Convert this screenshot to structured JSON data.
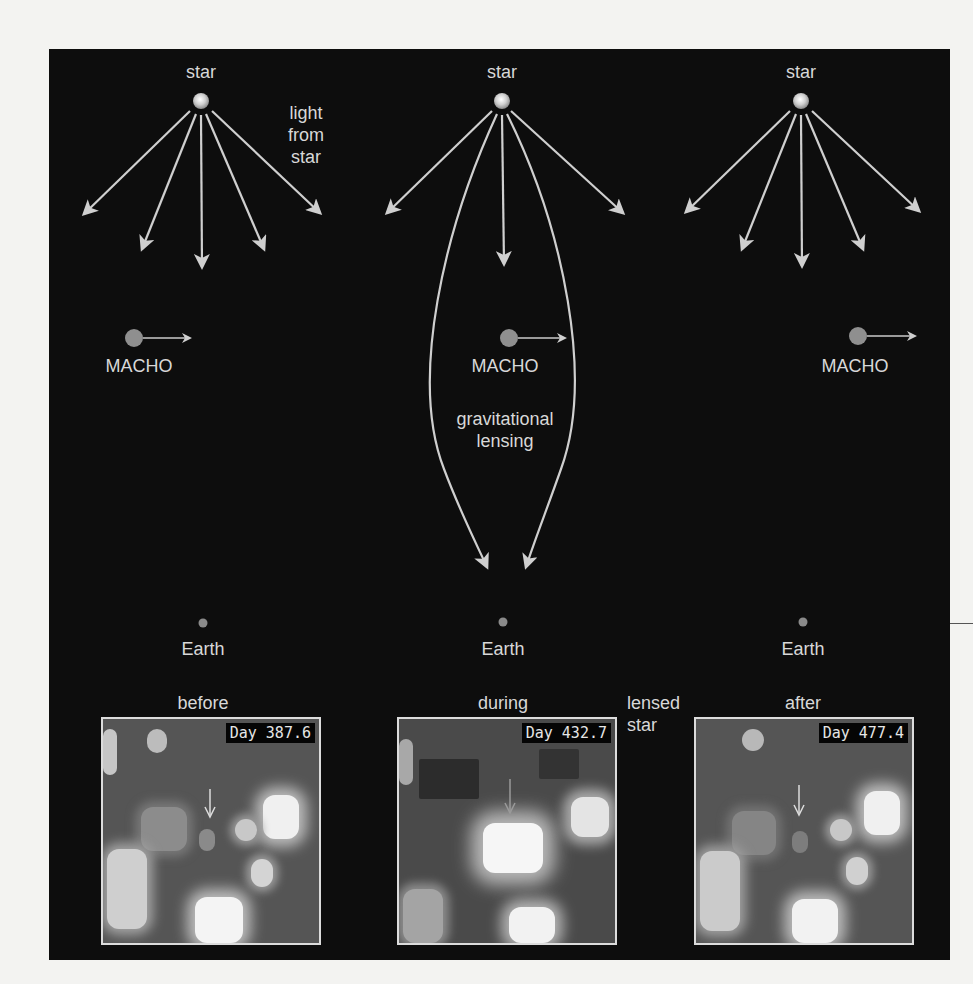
{
  "figure": {
    "background_color": "#0d0d0d",
    "line_color": "#d0d0d0",
    "panels": [
      {
        "id": "before",
        "star_label": "star",
        "macho_label": "MACHO",
        "earth_label": "Earth",
        "phase_label": "before",
        "annotation": "light\nfrom\nstar",
        "image_label": "Day 387.6"
      },
      {
        "id": "during",
        "star_label": "star",
        "macho_label": "MACHO",
        "earth_label": "Earth",
        "phase_label": "during",
        "annotation": "gravitational\nlensing",
        "image_label": "Day 432.7",
        "callout": "lensed\nstar"
      },
      {
        "id": "after",
        "star_label": "star",
        "macho_label": "MACHO",
        "earth_label": "Earth",
        "phase_label": "after",
        "image_label": "Day 477.4"
      }
    ]
  }
}
